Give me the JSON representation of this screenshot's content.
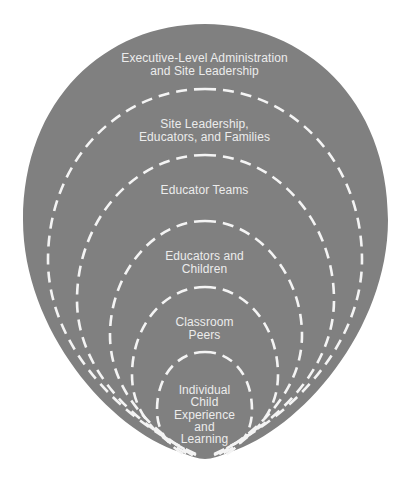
{
  "diagram": {
    "type": "nested-ecological-rings",
    "colors": {
      "fill": "#808080",
      "dash_stroke": "#f4f4f4",
      "text": "#ececec",
      "background": "#ffffff"
    },
    "levels": [
      {
        "name": "executive",
        "lines": [
          "Executive-Level Administration",
          "and Site Leadership"
        ]
      },
      {
        "name": "site-leadership",
        "lines": [
          "Site Leadership,",
          "Educators, and Families"
        ]
      },
      {
        "name": "educator-teams",
        "lines": [
          "Educator Teams"
        ]
      },
      {
        "name": "educators-children",
        "lines": [
          "Educators and",
          "Children"
        ]
      },
      {
        "name": "classroom-peers",
        "lines": [
          "Classroom",
          "Peers"
        ]
      },
      {
        "name": "individual-child",
        "lines": [
          "Individual",
          "Child",
          "Experience",
          "and",
          "Learning"
        ]
      }
    ]
  }
}
